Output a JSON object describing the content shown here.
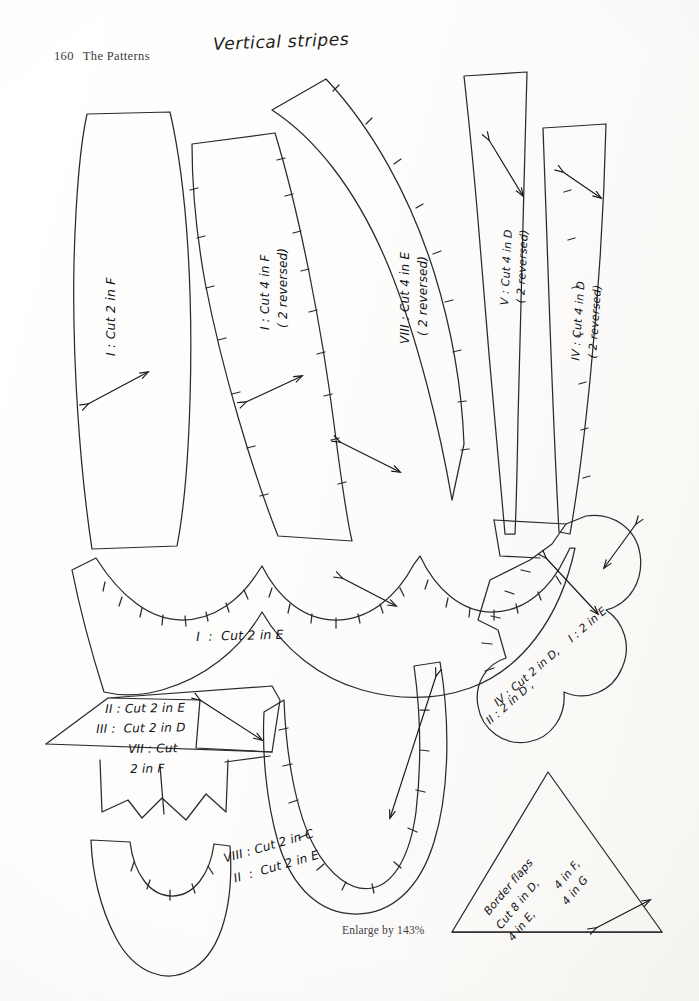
{
  "page": {
    "folio_number": "160",
    "section_title": "The Patterns",
    "hand_title": "Vertical stripes",
    "enlarge_note": "Enlarge by 143%"
  },
  "colors": {
    "paper": "#ffffff",
    "ink": "#121216",
    "printed_text": "#3b3b3b",
    "grid_light": "#e6e6e8",
    "grid_heavy": "#c4c4c6"
  },
  "grid": {
    "columns": 11,
    "rows": 15,
    "cell_px": 66,
    "heavy_every": 3
  },
  "pattern_pieces": [
    {
      "id": "piece-1-long-panel",
      "name": "long-curved-panel-F",
      "label_lines": [
        "I : Cut 2 in F"
      ],
      "rotation": -90,
      "grainline": true,
      "notches": false
    },
    {
      "id": "piece-2-curved-panel",
      "name": "curved-panel-F",
      "label_lines": [
        "I : Cut 4 in F",
        "( 2 reversed)"
      ],
      "rotation": -90,
      "grainline": true,
      "notches": true
    },
    {
      "id": "piece-3-wide-curve",
      "name": "wide-curved-panel-E",
      "label_lines": [
        "VIII : Cut 4 in E",
        "( 2 reversed)"
      ],
      "rotation": -90,
      "grainline": true,
      "notches": true
    },
    {
      "id": "piece-4-narrow-strip",
      "name": "narrow-strip-D",
      "label_lines": [
        "V : Cut 4 in D",
        "( 2 reversed)"
      ],
      "rotation": -90,
      "grainline": true,
      "notches": false
    },
    {
      "id": "piece-5-narrow-strip-2",
      "name": "narrow-strip-D-second",
      "label_lines": [
        "IV : Cut 4 in D",
        "( 2 reversed)"
      ],
      "rotation": -90,
      "grainline": true,
      "notches": true
    },
    {
      "id": "piece-6-scallop-band",
      "name": "scalloped-band-E",
      "label_lines": [
        "I : Cut 2 in E"
      ],
      "rotation": 0,
      "grainline": true,
      "notches": true
    },
    {
      "id": "piece-7-zigzag-flag",
      "name": "zigzag-flag-group",
      "label_lines": [
        "II : Cut 2 in E",
        "III :  Cut 2 in D",
        "VII : Cut",
        "2 in F"
      ],
      "rotation": 0,
      "grainline": true,
      "notches": false
    },
    {
      "id": "piece-8-rounded-tab",
      "name": "rounded-tab-C-E",
      "label_lines": [
        "VIII : Cut 2 in C",
        "II : Cut 2 in E"
      ],
      "rotation": -14,
      "grainline": true,
      "notches": true
    },
    {
      "id": "piece-9-cloud-scallop",
      "name": "cloud-scallop-D-E",
      "label_lines": [
        "IV : Cut 2 in D,  I : 2 in E",
        "II : 2 in D"
      ],
      "rotation": -40,
      "grainline": true,
      "notches": true
    },
    {
      "id": "piece-10-triangle",
      "name": "border-flap-triangle",
      "label_lines": [
        "Border flaps",
        "Cut 8 in D,",
        "4 in F,",
        "4 in E,",
        "4 in G"
      ],
      "rotation": -48,
      "grainline": true,
      "notches": false
    }
  ],
  "labels": {
    "p1": "I : Cut 2 in F",
    "p2a": "I : Cut 4 in F",
    "p2b": "( 2 reversed)",
    "p3a": "VIII : Cut 4 in E",
    "p3b": "( 2 reversed)",
    "p4a": "V : Cut 4 in D",
    "p4b": "( 2 reversed)",
    "p5a": "IV : Cut 4 in D",
    "p5b": "( 2 reversed)",
    "p6": "I  :  Cut 2 in E",
    "p7a": "II : Cut 2 in E",
    "p7b": "III :  Cut 2 in D",
    "p7c": "VII : Cut",
    "p7d": "2 in F",
    "p8a": "VIII : Cut 2 in C",
    "p8b": "II  :  Cut 2 in E",
    "p9a": "IV : Cut 2 in D,",
    "p9b": "I : 2 in E",
    "p9c": "II : 2 in D ,",
    "p10a": "Border flaps",
    "p10b": "Cut 8 in D,",
    "p10c": "4 in F,",
    "p10d": "4 in E,",
    "p10e": "4 in G"
  }
}
